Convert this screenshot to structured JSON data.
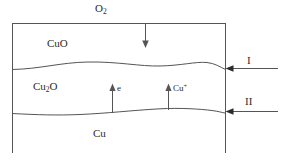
{
  "figure": {
    "type": "schematic-diagram",
    "stroke_color": "#555555",
    "text_color": "#2b2b2b",
    "background_color": "#ffffff"
  },
  "labels": {
    "oxygen": {
      "text": "O",
      "sub": "2"
    },
    "layer_cuo": {
      "text": "CuO"
    },
    "layer_cu2o": {
      "text": "Cu",
      "sub": "2",
      "text_tail": "O"
    },
    "layer_cu": {
      "text": "Cu"
    },
    "electron": {
      "text": "e"
    },
    "copper_ion": {
      "text": "Cu",
      "sup": "+"
    },
    "interface_one": {
      "text": "I"
    },
    "interface_two": {
      "text": "II"
    }
  },
  "arrows": {
    "oxygen_inflow": {
      "direction": "down",
      "label": "O2"
    },
    "electron_migration": {
      "direction": "up",
      "label": "e"
    },
    "copper_ion_migration": {
      "direction": "up",
      "label": "Cu+"
    },
    "interface_one_pointer": {
      "direction": "left",
      "label": "I"
    },
    "interface_two_pointer": {
      "direction": "left",
      "label": "II"
    }
  },
  "regions": [
    {
      "name": "CuO",
      "position": "top"
    },
    {
      "name": "Cu2O",
      "position": "middle"
    },
    {
      "name": "Cu",
      "position": "bottom"
    }
  ]
}
